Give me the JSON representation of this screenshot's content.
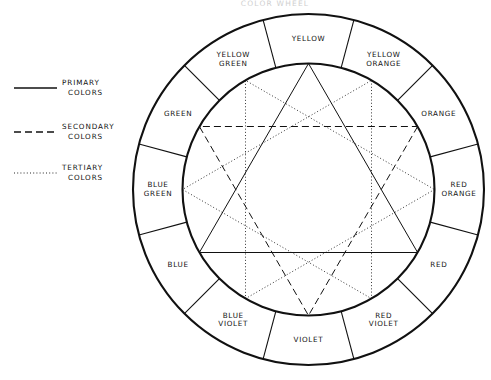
{
  "title": "COLOR WHEEL",
  "geometry": {
    "cx": 308.5,
    "cy": 189.5,
    "outer_radius": 175.5,
    "inner_radius": 126.0,
    "label_radius": 150.5,
    "segments": 12,
    "segment_degrees": 30
  },
  "colors": {
    "stroke": "#111111",
    "background": "#ffffff",
    "title": "#cfcfcf"
  },
  "legend": {
    "items": [
      {
        "label_line1": "PRIMARY",
        "label_line2": "COLORS",
        "style": "solid",
        "swatch": "solid-line-swatch"
      },
      {
        "label_line1": "SECONDARY",
        "label_line2": "COLORS",
        "style": "dashed",
        "swatch": "dashed-line-swatch"
      },
      {
        "label_line1": "TERTIARY",
        "label_line2": "COLORS",
        "style": "dotted",
        "swatch": "dotted-line-swatch"
      }
    ]
  },
  "wheel": {
    "segments": [
      {
        "name": "yellow",
        "line1": "YELLOW",
        "line2": "",
        "angle_deg": 0,
        "category": "primary"
      },
      {
        "name": "yellow-orange",
        "line1": "YELLOW",
        "line2": "ORANGE",
        "angle_deg": 30,
        "category": "tertiary"
      },
      {
        "name": "orange",
        "line1": "ORANGE",
        "line2": "",
        "angle_deg": 60,
        "category": "secondary"
      },
      {
        "name": "red-orange",
        "line1": "RED",
        "line2": "ORANGE",
        "angle_deg": 90,
        "category": "tertiary"
      },
      {
        "name": "red",
        "line1": "RED",
        "line2": "",
        "angle_deg": 120,
        "category": "primary"
      },
      {
        "name": "red-violet",
        "line1": "RED",
        "line2": "VIOLET",
        "angle_deg": 150,
        "category": "tertiary"
      },
      {
        "name": "violet",
        "line1": "VIOLET",
        "line2": "",
        "angle_deg": 180,
        "category": "secondary"
      },
      {
        "name": "blue-violet",
        "line1": "BLUE",
        "line2": "VIOLET",
        "angle_deg": 210,
        "category": "tertiary"
      },
      {
        "name": "blue",
        "line1": "BLUE",
        "line2": "",
        "angle_deg": 240,
        "category": "primary"
      },
      {
        "name": "blue-green",
        "line1": "BLUE",
        "line2": "GREEN",
        "angle_deg": 270,
        "category": "tertiary"
      },
      {
        "name": "green",
        "line1": "GREEN",
        "line2": "",
        "angle_deg": 300,
        "category": "secondary"
      },
      {
        "name": "yellow-green",
        "line1": "YELLOW",
        "line2": "GREEN",
        "angle_deg": 330,
        "category": "tertiary"
      }
    ],
    "triangles": [
      {
        "name": "primary-triangle",
        "style": "solid",
        "vertices_deg": [
          0,
          120,
          240
        ]
      },
      {
        "name": "secondary-triangle",
        "style": "dashed",
        "vertices_deg": [
          60,
          180,
          300
        ]
      },
      {
        "name": "tertiary-triangle-warm",
        "style": "dotted",
        "vertices_deg": [
          30,
          150,
          270
        ]
      },
      {
        "name": "tertiary-triangle-cool",
        "style": "dotted",
        "vertices_deg": [
          90,
          210,
          330
        ]
      }
    ]
  }
}
